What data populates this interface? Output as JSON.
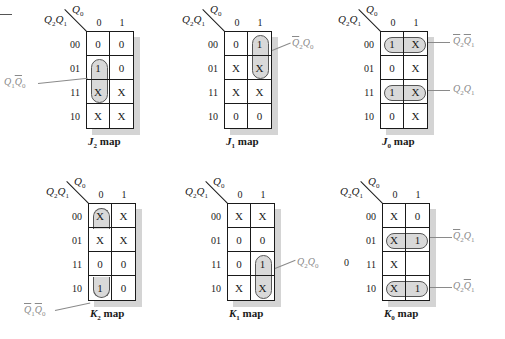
{
  "figure": {
    "row_var": "Q2Q1",
    "col_var": "Q0",
    "column_headers": [
      "0",
      "1"
    ],
    "row_headers": [
      "00",
      "01",
      "11",
      "10"
    ],
    "stray_value": "0"
  },
  "maps": [
    {
      "id": "J2",
      "caption_letter": "J",
      "caption_sub": "2",
      "caption_suffix": " map",
      "cells": [
        [
          "0",
          "0"
        ],
        [
          "1",
          "0"
        ],
        [
          "X",
          "X"
        ],
        [
          "X",
          "X"
        ]
      ],
      "groups": [
        {
          "term": "Q1·Q̄0",
          "cells": "rows 01-11, col 0"
        }
      ]
    },
    {
      "id": "J1",
      "caption_letter": "J",
      "caption_sub": "1",
      "caption_suffix": " map",
      "cells": [
        [
          "0",
          "1"
        ],
        [
          "X",
          "X"
        ],
        [
          "X",
          "X"
        ],
        [
          "0",
          "0"
        ]
      ],
      "groups": [
        {
          "term": "Q̄2·Q0",
          "cells": "rows 00-01, col 1"
        }
      ]
    },
    {
      "id": "J0",
      "caption_letter": "J",
      "caption_sub": "0",
      "caption_suffix": " map",
      "cells": [
        [
          "1",
          "X"
        ],
        [
          "0",
          "X"
        ],
        [
          "1",
          "X"
        ],
        [
          "0",
          "X"
        ]
      ],
      "groups": [
        {
          "term": "Q̄2·Q̄1",
          "cells": "row 00"
        },
        {
          "term": "Q2·Q1",
          "cells": "row 11"
        }
      ]
    },
    {
      "id": "K2",
      "caption_letter": "K",
      "caption_sub": "2",
      "caption_suffix": " map",
      "cells": [
        [
          "X",
          "X"
        ],
        [
          "X",
          "X"
        ],
        [
          "0",
          "0"
        ],
        [
          "1",
          "0"
        ]
      ],
      "groups": [
        {
          "term": "Q̄1·Q̄0",
          "cells": "rows 00 & 10 (wrap), col 0"
        }
      ]
    },
    {
      "id": "K1",
      "caption_letter": "K",
      "caption_sub": "1",
      "caption_suffix": " map",
      "cells": [
        [
          "X",
          "X"
        ],
        [
          "0",
          "0"
        ],
        [
          "0",
          "1"
        ],
        [
          "X",
          "X"
        ]
      ],
      "groups": [
        {
          "term": "Q2·Q0",
          "cells": "rows 11-10, col 1"
        }
      ]
    },
    {
      "id": "K0",
      "caption_letter": "K",
      "caption_sub": "0",
      "caption_suffix": " map",
      "cells": [
        [
          "X",
          "0"
        ],
        [
          "X",
          "1"
        ],
        [
          "X",
          ""
        ],
        [
          "X",
          "1"
        ]
      ],
      "groups": [
        {
          "term": "Q̄2·Q1",
          "cells": "row 01"
        },
        {
          "term": "Q2·Q̄1",
          "cells": "row 10"
        }
      ]
    }
  ],
  "annotations": {
    "j2": {
      "a": "Q",
      "a_sub": "1",
      "b": "Q",
      "b_sub": "0"
    },
    "j1": {
      "a": "Q",
      "a_sub": "2",
      "b": "Q",
      "b_sub": "0"
    },
    "j0_top": {
      "a": "Q",
      "a_sub": "2",
      "b": "Q",
      "b_sub": "1"
    },
    "j0_bot": {
      "a": "Q",
      "a_sub": "2",
      "b": "Q",
      "b_sub": "1"
    },
    "k2": {
      "a": "Q",
      "a_sub": "1",
      "b": "Q",
      "b_sub": "0"
    },
    "k1": {
      "a": "Q",
      "a_sub": "2",
      "b": "Q",
      "b_sub": "0"
    },
    "k0_top": {
      "a": "Q",
      "a_sub": "2",
      "b": "Q",
      "b_sub": "1"
    },
    "k0_bot": {
      "a": "Q",
      "a_sub": "2",
      "b": "Q",
      "b_sub": "1"
    }
  },
  "labels": {
    "q0": "Q",
    "q0_sub": "0",
    "q2": "Q",
    "q2_sub": "2",
    "q1": "Q",
    "q1_sub": "1"
  }
}
